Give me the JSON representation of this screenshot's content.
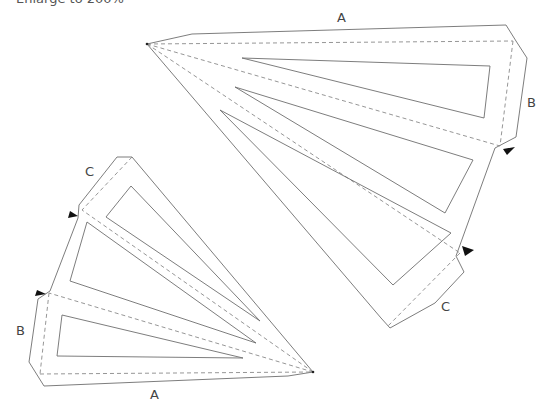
{
  "caption": "Enlarge to 200%",
  "labels": {
    "top_piece": {
      "A": "A",
      "B": "B",
      "C": "C"
    },
    "bottom_piece": {
      "A": "A",
      "B": "B",
      "C": "C"
    }
  },
  "colors": {
    "cut_line": "#6e6e6e",
    "fold_line": "#8a8a8a",
    "marker": "#111111"
  },
  "pieces": [
    {
      "name": "top-right-template",
      "apex": [
        147,
        44
      ],
      "outline": "147,44 192,34 506,25 516,41 527,58 516,137 495,148 456,256 464,272 435,303 390,328 381,318",
      "folds": [
        "147,44 513,41",
        "513,41 500,146",
        "147,44 500,146",
        "147,44 460,253",
        "460,253 388,326"
      ],
      "windows": [
        "242,58 490,66 484,118",
        "235,87 473,160 445,213",
        "220,110 451,233 393,285"
      ],
      "markers": [
        "503,149 515,147 507,155",
        "462,246 474,250 465,256"
      ]
    },
    {
      "name": "bottom-left-template",
      "apex": [
        313,
        372
      ],
      "outline": "313,372 288,376 44,386 29,362 38,299 50,291 78,218 79,205 117,157 132,157",
      "folds": [
        "132,157 82,210",
        "313,372 82,210",
        "313,372 49,293",
        "49,293 40,374",
        "40,374 313,372"
      ],
      "windows": [
        "131,186 106,217 260,321",
        "87,222 70,281 256,343",
        "62,315 57,356 243,358"
      ],
      "markers": [
        "70,211 78,216 68,218",
        "37,290 46,294 35,296"
      ]
    }
  ]
}
